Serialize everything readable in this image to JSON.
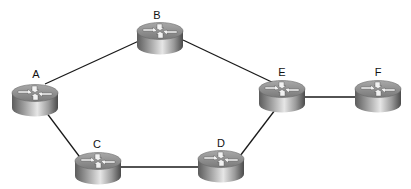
{
  "diagram": {
    "type": "network-topology",
    "node_icon": "router-icon",
    "colors": {
      "background": "#ffffff",
      "link": "#1a1a1a",
      "router_top": "#8e8e8e",
      "router_side_dark": "#5c5c5c",
      "router_side_light": "#d9d9d9",
      "arrow": "#f2f2f2",
      "label": "#111111"
    },
    "nodes": [
      {
        "id": "A",
        "label": "A",
        "cx": 35,
        "cy": 93,
        "label_x": 36,
        "label_y": 69
      },
      {
        "id": "B",
        "label": "B",
        "cx": 160,
        "cy": 31,
        "label_x": 157,
        "label_y": 10
      },
      {
        "id": "C",
        "label": "C",
        "cx": 98,
        "cy": 161,
        "label_x": 97,
        "label_y": 139
      },
      {
        "id": "D",
        "label": "D",
        "cx": 221,
        "cy": 159,
        "label_x": 221,
        "label_y": 138
      },
      {
        "id": "E",
        "label": "E",
        "cx": 282,
        "cy": 89,
        "label_x": 282,
        "label_y": 67
      },
      {
        "id": "F",
        "label": "F",
        "cx": 378,
        "cy": 89,
        "label_x": 378,
        "label_y": 67
      }
    ],
    "links": [
      {
        "from": "A",
        "to": "B",
        "x1": 45,
        "y1": 84,
        "x2": 141,
        "y2": 40
      },
      {
        "from": "B",
        "to": "E",
        "x1": 183,
        "y1": 40,
        "x2": 276,
        "y2": 84
      },
      {
        "from": "A",
        "to": "C",
        "x1": 46,
        "y1": 112,
        "x2": 82,
        "y2": 160
      },
      {
        "from": "C",
        "to": "D",
        "x1": 120,
        "y1": 167,
        "x2": 200,
        "y2": 167
      },
      {
        "from": "D",
        "to": "E",
        "x1": 240,
        "y1": 156,
        "x2": 275,
        "y2": 110
      },
      {
        "from": "E",
        "to": "F",
        "x1": 304,
        "y1": 97,
        "x2": 356,
        "y2": 97
      }
    ]
  }
}
